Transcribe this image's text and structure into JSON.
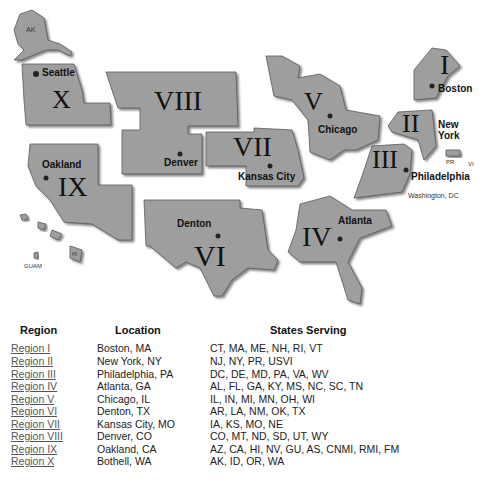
{
  "map": {
    "regions": [
      {
        "numeral": "I",
        "city": "Boston"
      },
      {
        "numeral": "II",
        "city": "New York"
      },
      {
        "numeral": "III",
        "city": "Philadelphia"
      },
      {
        "numeral": "IV",
        "city": "Atlanta"
      },
      {
        "numeral": "V",
        "city": "Chicago"
      },
      {
        "numeral": "VI",
        "city": "Denton"
      },
      {
        "numeral": "VII",
        "city": "Kansas City"
      },
      {
        "numeral": "VIII",
        "city": "Denver"
      },
      {
        "numeral": "IX",
        "city": "Oakland"
      },
      {
        "numeral": "X",
        "city": "Seattle"
      }
    ],
    "labels": {
      "ak": "AK",
      "hi": "HI",
      "guam": "GUAM",
      "pr": "PR",
      "vi": "VI",
      "washington_dc": "Washington, DC",
      "new_york_line1": "New",
      "new_york_line2": "York"
    }
  },
  "table": {
    "headers": {
      "region": "Region",
      "location": "Location",
      "states": "States Serving"
    },
    "rows": [
      {
        "region": "Region I",
        "location": "Boston, MA",
        "states": "CT, MA, ME, NH, RI, VT"
      },
      {
        "region": "Region II",
        "location": "New York, NY",
        "states": "NJ, NY, PR, USVI"
      },
      {
        "region": "Region III",
        "location": "Philadelphia, PA",
        "states": "DC, DE, MD, PA, VA, WV"
      },
      {
        "region": "Region IV",
        "location": "Atlanta, GA",
        "states": "AL, FL, GA, KY, MS, NC, SC, TN"
      },
      {
        "region": "Region V",
        "location": "Chicago, IL",
        "states": "IL, IN, MI, MN, OH, WI"
      },
      {
        "region": "Region VI",
        "location": "Denton, TX",
        "states": "AR, LA, NM, OK, TX"
      },
      {
        "region": "Region VII",
        "location": "Kansas City, MO",
        "states": "IA, KS, MO, NE"
      },
      {
        "region": "Region VIII",
        "location": "Denver, CO",
        "states": "CO, MT, ND, SD, UT, WY"
      },
      {
        "region": "Region IX",
        "location": "Oakland, CA",
        "states": "AZ, CA, HI, NV, GU, AS, CNMI, RMI, FM"
      },
      {
        "region": "Region X",
        "location": "Bothell, WA",
        "states": "AK, ID, OR, WA"
      }
    ]
  }
}
